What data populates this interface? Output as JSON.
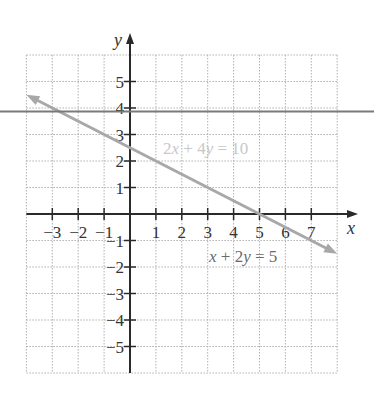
{
  "chart_data": {
    "type": "line",
    "title": "",
    "xlabel": "x",
    "ylabel": "y",
    "xlim": [
      -4,
      8
    ],
    "ylim": [
      -6,
      6
    ],
    "grid": true,
    "grid_style": "dotted",
    "x_ticks": [
      -3,
      -2,
      -1,
      1,
      2,
      3,
      4,
      5,
      6,
      7
    ],
    "x_tick_labels": [
      "−3",
      "−2",
      "−1",
      "1",
      "2",
      "3",
      "4",
      "5",
      "6",
      "7"
    ],
    "y_ticks": [
      5,
      4,
      3,
      2,
      1,
      -1,
      -2,
      -3,
      -4,
      -5
    ],
    "y_tick_labels": [
      "5",
      "4",
      "3",
      "2",
      "1",
      "−1",
      "−2",
      "−3",
      "−4",
      "−5"
    ],
    "series": [
      {
        "name": "x + 2y = 5",
        "equation": "x + 2y = 5",
        "equivalent_equation": "2x + 4y = 10",
        "slope": -0.5,
        "y_intercept": 2.5,
        "x_intercept": 5,
        "x": [
          -4,
          8
        ],
        "y": [
          4.5,
          -1.5
        ],
        "arrows": "both",
        "color": "#a8a8a8"
      },
      {
        "name": "horizontal line",
        "y_value": 3.85,
        "extends": "full width",
        "color": "#7a7a7a"
      }
    ],
    "annotations": [
      {
        "text": "2x + 4y = 10",
        "position": [
          1.3,
          2.3
        ],
        "color": "#c8c8c8"
      },
      {
        "text": "x + 2y = 5",
        "position": [
          3.0,
          -1.6
        ],
        "color": "#6a6a6a"
      }
    ]
  },
  "labels": {
    "x_axis": "x",
    "y_axis": "y",
    "eq1": {
      "coef": "2",
      "v1": "x",
      "op": " + 4",
      "v2": "y",
      "rhs": " = 10"
    },
    "eq2": {
      "v1": "x",
      "op": " + 2",
      "v2": "y",
      "rhs": " = 5"
    }
  },
  "colors": {
    "axis": "#2a2a2a",
    "grid": "#b0b0b0",
    "line": "#a8a8a8",
    "horizontal_line": "#7a7a7a"
  }
}
